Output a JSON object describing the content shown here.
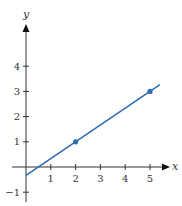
{
  "chart_data": {
    "type": "line",
    "title": "",
    "xlabel": "x",
    "ylabel": "y",
    "xlim": [
      -0.9,
      6.2
    ],
    "ylim": [
      -1.4,
      5.6
    ],
    "grid": false,
    "legend": null,
    "x_ticks": [
      1,
      2,
      3,
      4,
      5
    ],
    "y_ticks": [
      -1,
      1,
      2,
      3,
      4
    ],
    "x_tick_labels": [
      "1",
      "2",
      "3",
      "4",
      "5"
    ],
    "y_tick_labels": [
      "−1",
      "1",
      "2",
      "3",
      "4"
    ],
    "series": [
      {
        "name": "line",
        "color": "#2e6db4",
        "x": [
          0,
          5.4
        ],
        "y": [
          -0.333,
          3.267
        ],
        "equation": "y = (2/3)x - 1/3"
      }
    ],
    "points": [
      {
        "x": 2,
        "y": 1
      },
      {
        "x": 5,
        "y": 3
      }
    ]
  },
  "axes": {
    "x_label": "x",
    "y_label": "y",
    "axis_color": "#333333",
    "line_color": "#2e6db4"
  }
}
